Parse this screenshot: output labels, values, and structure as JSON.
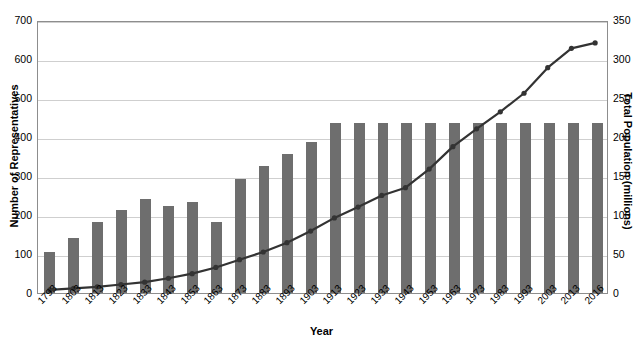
{
  "chart_data": {
    "type": "bar",
    "title": "",
    "xlabel": "Year",
    "ylabel": "Number of Representatives",
    "ylabel_secondary": "Total Population (millions)",
    "categories": [
      "1793",
      "1803",
      "1813",
      "1823",
      "1833",
      "1843",
      "1853",
      "1863",
      "1873",
      "1883",
      "1893",
      "1903",
      "1913",
      "1923",
      "1933",
      "1943",
      "1953",
      "1963",
      "1973",
      "1983",
      "1993",
      "2003",
      "2013",
      "2016"
    ],
    "ylim": [
      0,
      700
    ],
    "yticks": [
      "0",
      "100",
      "200",
      "300",
      "400",
      "500",
      "600",
      "700"
    ],
    "ylim_secondary": [
      0,
      350
    ],
    "yticks_secondary": [
      "0",
      "50",
      "100",
      "150",
      "200",
      "250",
      "300",
      "350"
    ],
    "grid": true,
    "legend": "none",
    "series": [
      {
        "name": "Number of Representatives",
        "type": "bar",
        "axis": "left",
        "color": "#6e6e6e",
        "values": [
          105,
          142,
          182,
          213,
          240,
          223,
          234,
          183,
          292,
          325,
          356,
          386,
          435,
          435,
          435,
          435,
          435,
          435,
          435,
          435,
          435,
          435,
          435,
          435
        ]
      },
      {
        "name": "Total Population (millions)",
        "type": "line",
        "axis": "right",
        "color": "#333333",
        "values": [
          4,
          6,
          8,
          11,
          14,
          19,
          25,
          33,
          43,
          53,
          65,
          80,
          97,
          111,
          126,
          136,
          160,
          189,
          212,
          234,
          258,
          291,
          316,
          323
        ]
      }
    ]
  }
}
